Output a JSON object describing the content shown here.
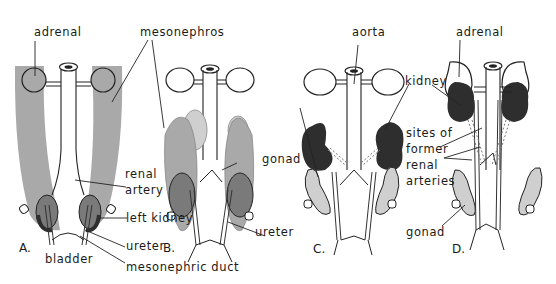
{
  "figure": {
    "colors": {
      "mesonephros": "#a9a9a9",
      "kidney_dark": "#2e2e2e",
      "kidney_mid": "#7a7a7a",
      "gonad": "#cfcfcf",
      "outline": "#222222",
      "background": "#ffffff"
    },
    "panels": [
      {
        "letter": "A."
      },
      {
        "letter": "B."
      },
      {
        "letter": "C."
      },
      {
        "letter": "D."
      }
    ],
    "labels": {
      "adrenal_a": "adrenal",
      "mesonephros": "mesonephros",
      "renal_artery_1": "renal",
      "renal_artery_2": "artery",
      "left_kidney": "left kidney",
      "ureter_a": "ureter",
      "bladder": "bladder",
      "mesonephric_duct": "mesonephric duct",
      "gonad_b": "gonad",
      "ureter_b": "ureter",
      "aorta": "aorta",
      "kidney": "kidney",
      "adrenal_d": "adrenal",
      "sites_1": "sites of",
      "sites_2": "former",
      "sites_3": "renal",
      "sites_4": "arteries",
      "gonad_d": "gonad"
    }
  }
}
